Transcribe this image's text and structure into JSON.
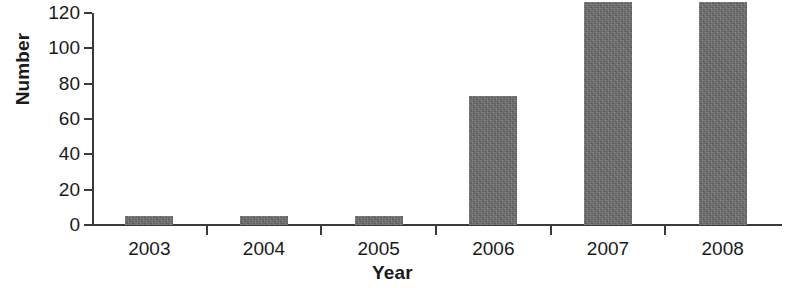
{
  "chart_data": {
    "type": "bar",
    "title": "",
    "xlabel": "Year",
    "ylabel": "Number",
    "categories": [
      "2003",
      "2004",
      "2005",
      "2006",
      "2007",
      "2008"
    ],
    "values": [
      5,
      5,
      5,
      73,
      126,
      126
    ],
    "ylim": [
      0,
      120
    ],
    "yticks": [
      0,
      20,
      40,
      60,
      80,
      100,
      120
    ],
    "ytick_labels": [
      "0",
      "20",
      "40",
      "60",
      "80",
      "100",
      "120"
    ],
    "grid": false,
    "legend": null,
    "bar_color": "#6e6e6e",
    "axis_color": "#3a3a3a",
    "text_color": "#1a1a1a",
    "series": [
      {
        "name": "Number",
        "values": [
          5,
          5,
          5,
          73,
          126,
          126
        ]
      }
    ]
  }
}
